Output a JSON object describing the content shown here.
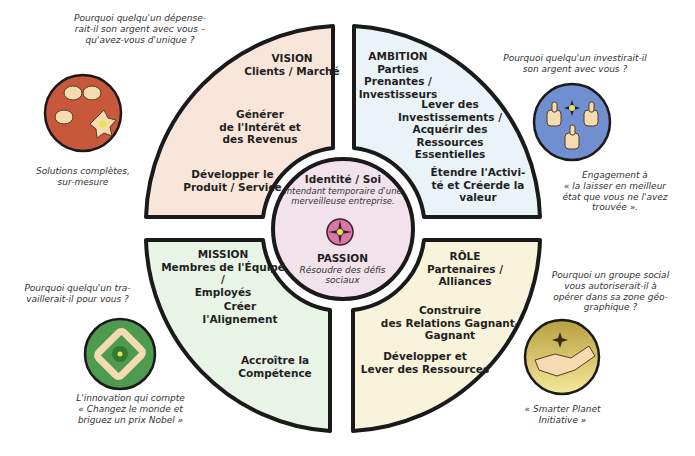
{
  "colors": {
    "vision_fill": "#f8e6da",
    "ambition_fill": "#eaf4f8",
    "mission_fill": "#e8f4e6",
    "role_fill": "#f8f4dc",
    "center_fill": "#f2e2ec",
    "outline": "#1a1a1a",
    "icon_red": "#c8583c",
    "icon_blue": "#6f8fd0",
    "icon_green": "#4e9a4e",
    "icon_gold": "#d8c060",
    "icon_center": "#d878a8"
  },
  "center": {
    "identity_title": "Identité / Soi",
    "identity_line1": "Intendant temporaire d'une",
    "identity_line2": "merveilleuse entreprise.",
    "passion_title": "PASSION",
    "passion_line1": "Résoudre des défis",
    "passion_line2": "sociaux"
  },
  "quadrants": {
    "vision": {
      "title": "VISION",
      "subtitle": "Clients / Marché",
      "item1": [
        "Générer",
        "de l'Intérêt et",
        "des Revenus"
      ],
      "item2": [
        "Développer le",
        "Produit / Service"
      ]
    },
    "ambition": {
      "title": "AMBITION",
      "subtitle": [
        "Parties",
        "Prenantes /",
        "Investisseurs"
      ],
      "item1": [
        "Lever des",
        "Investissements /",
        "Acquérir des",
        "Ressources",
        "Essentielles"
      ],
      "item2": [
        "Étendre l'Activi-",
        "té et Créerde la",
        "valeur"
      ]
    },
    "mission": {
      "title": "MISSION",
      "subtitle": [
        "Membres de l'Équipe /",
        "Employés"
      ],
      "item1": [
        "Créer",
        "l'Alignement"
      ],
      "item2": [
        "Accroître la",
        "Compétence"
      ]
    },
    "role": {
      "title": "RÔLE",
      "subtitle": [
        "Partenaires /",
        "Alliances"
      ],
      "item1": [
        "Construire",
        "des Relations Gagnant-",
        "Gagnant"
      ],
      "item2": [
        "Développer et",
        "Lever des Ressources"
      ]
    }
  },
  "corners": {
    "top_left": {
      "question": [
        "Pourquoi quelqu'un dépense-",
        "rait-il son argent avec vous –",
        "qu'avez-vous d'unique ?"
      ],
      "caption": [
        "Solutions complètes,",
        "sur-mesure"
      ],
      "icon": "hands-flower-icon"
    },
    "top_right": {
      "question": [
        "Pourquoi quelqu'un investirait-il",
        "son argent avec vous ?"
      ],
      "caption": [
        "Engagement à",
        "«  la laisser en meilleur",
        "état que vous ne l'avez",
        "trouvée  »."
      ],
      "icon": "thumbs-up-icon"
    },
    "bottom_left": {
      "question": [
        "Pourquoi quelqu'un tra-",
        "vaillerait-il pour vous ?"
      ],
      "caption": [
        "L'innovation qui compte",
        "«  Changez le monde et",
        "briguez un prix Nobel  »"
      ],
      "icon": "linked-hands-icon"
    },
    "bottom_right": {
      "question": [
        "Pourquoi un groupe social",
        "vous autoriserait-il à",
        "opérer dans sa zone géo-",
        "graphique ?"
      ],
      "caption": [
        "«  Smarter Planet",
        "Initiative  »"
      ],
      "icon": "handshake-icon"
    }
  }
}
